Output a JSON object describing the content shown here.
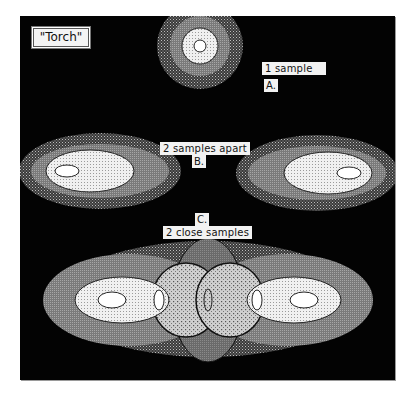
{
  "figure": {
    "title": "\"Torch\"",
    "panels": [
      {
        "id": "A",
        "letter": "A.",
        "caption": "1 sample"
      },
      {
        "id": "B",
        "letter": "B.",
        "caption": "2 samples apart"
      },
      {
        "id": "C",
        "letter": "C.",
        "caption": "2 close samples"
      }
    ],
    "colors": {
      "background": "#030303",
      "outer_ring": "#6e6e6e",
      "middle_ring": "#8c8c8c",
      "inner_ring": "#e6e6e6",
      "core": "#ffffff",
      "overlap": "#bdbdbd"
    }
  }
}
